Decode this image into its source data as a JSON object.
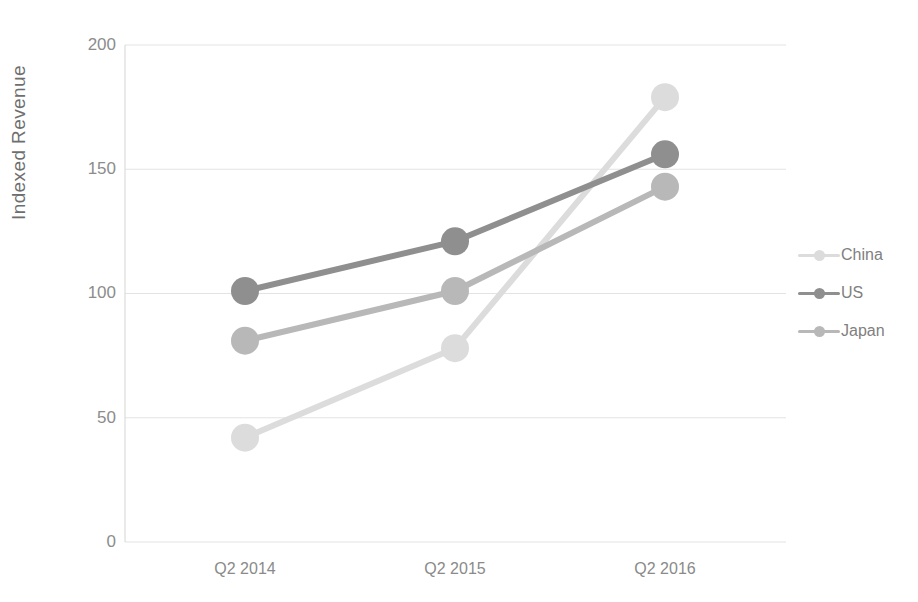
{
  "chart_data": {
    "type": "line",
    "title": "",
    "subtitle": "",
    "xlabel": "",
    "ylabel": "Indexed Revenue",
    "categories": [
      "Q2 2014",
      "Q2 2015",
      "Q2 2016"
    ],
    "ylim": [
      0,
      200
    ],
    "yticks": [
      0,
      50,
      100,
      150,
      200
    ],
    "ytick_labels": [
      "0",
      "50",
      "100",
      "150",
      "200"
    ],
    "grid": "horizontal",
    "legend_position": "right",
    "series": [
      {
        "name": "China",
        "values": [
          42,
          78,
          179
        ],
        "color": "#dcdcdc",
        "marker": "circle"
      },
      {
        "name": "US",
        "values": [
          101,
          121,
          156
        ],
        "color": "#8f8f8f",
        "marker": "circle"
      },
      {
        "name": "Japan",
        "values": [
          81,
          101,
          143
        ],
        "color": "#b8b8b8",
        "marker": "circle"
      }
    ]
  },
  "legend": {
    "items": [
      {
        "label": "China"
      },
      {
        "label": "US"
      },
      {
        "label": "Japan"
      }
    ]
  },
  "axes": {
    "y_title": "Indexed Revenue",
    "y_labels": [
      "200",
      "150",
      "100",
      "50",
      "0"
    ],
    "x_labels": [
      "Q2 2014",
      "Q2 2015",
      "Q2 2016"
    ]
  },
  "colors": {
    "background": "#ffffff",
    "grid": "#e3e3e3",
    "axis": "#d5d5d5",
    "text": "#8a8a8a",
    "china": "#dcdcdc",
    "us": "#8f8f8f",
    "japan": "#b8b8b8"
  }
}
